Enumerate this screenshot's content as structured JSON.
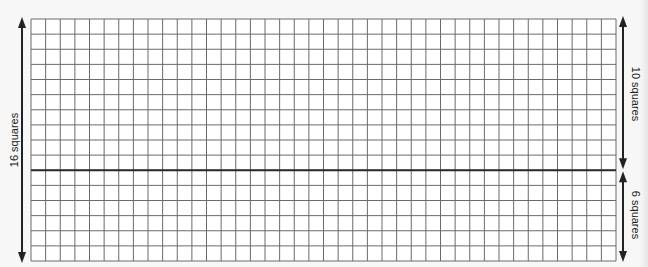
{
  "diagram": {
    "type": "grid-with-dimension-arrows",
    "grid": {
      "columns": 40,
      "rows": 16,
      "divider_after_row": 10,
      "line_color": "#6a6a6a",
      "divider_color": "#2a2a2a",
      "background": "#ffffff"
    },
    "labels": {
      "total_height": "16 squares",
      "top_section": "10 squares",
      "bottom_section": "6 squares"
    },
    "arrow_color": "#222222"
  }
}
